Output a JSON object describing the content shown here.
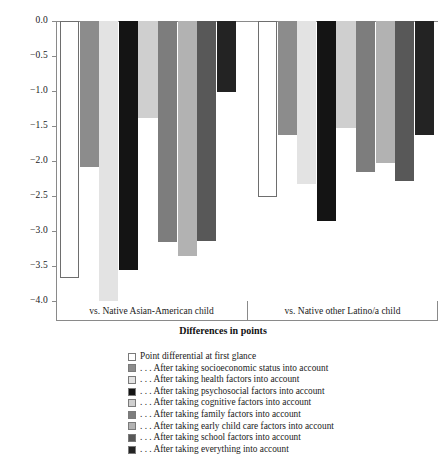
{
  "chart_data": {
    "type": "bar",
    "title": "",
    "xlabel": "Differences in points",
    "ylabel": "",
    "ylim": [
      -4.0,
      0.0
    ],
    "ytick_labels": [
      "0.0",
      "-0.5",
      "-1.0",
      "-1.5",
      "-2.0",
      "-2.5",
      "-3.0",
      "-3.5",
      "-4.0"
    ],
    "ytick_values": [
      0.0,
      -0.5,
      -1.0,
      -1.5,
      -2.0,
      -2.5,
      -3.0,
      -3.5,
      -4.0
    ],
    "grid": false,
    "legend_position": "below",
    "categories": [
      "vs. Native Asian-American child",
      "vs. Native other Latino/a child"
    ],
    "series": [
      {
        "name": "Point differential at first glance",
        "color": "#ffffff",
        "values": [
          -3.67,
          -2.52
        ]
      },
      {
        "name": ". . . After taking socioeconomic status into account",
        "color": "#8c8c8c",
        "values": [
          -2.08,
          -1.63
        ]
      },
      {
        "name": ". . . After taking health factors into account",
        "color": "#e3e3e3",
        "values": [
          -4.0,
          -2.33
        ]
      },
      {
        "name": ". . . After taking psychosocial factors into account",
        "color": "#141414",
        "values": [
          -3.56,
          -2.85
        ]
      },
      {
        "name": ". . . After taking cognitive factors into account",
        "color": "#cfcfcf",
        "values": [
          -1.38,
          -1.53
        ]
      },
      {
        "name": ". . . After taking family factors into account",
        "color": "#7d7d7d",
        "values": [
          -3.15,
          -2.15
        ]
      },
      {
        "name": ". . . After taking early child care factors into account",
        "color": "#b2b2b2",
        "values": [
          -3.35,
          -2.03
        ]
      },
      {
        "name": ". . . After taking school factors into account",
        "color": "#585858",
        "values": [
          -3.14,
          -2.29
        ]
      },
      {
        "name": ". . . After taking everything into account",
        "color": "#232323",
        "values": [
          -1.01,
          -1.63
        ]
      }
    ]
  },
  "axis": {
    "x_title": "Differences in points"
  }
}
